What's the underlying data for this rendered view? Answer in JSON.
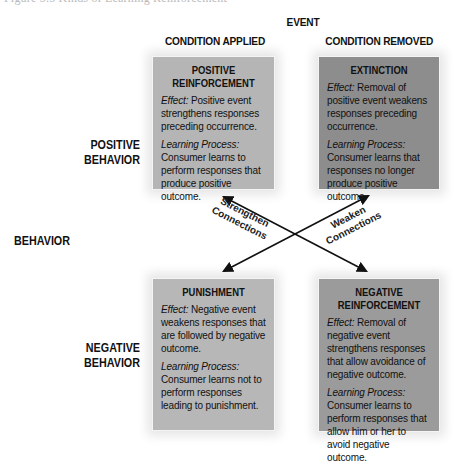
{
  "caption_fragment": "Figure 3.3 Kinds of Learning Reinforcement",
  "headers": {
    "event": "EVENT",
    "condition_applied": "CONDITION APPLIED",
    "condition_removed": "CONDITION REMOVED",
    "behavior": "BEHAVIOR",
    "positive_behavior_line1": "POSITIVE",
    "positive_behavior_line2": "BEHAVIOR",
    "negative_behavior_line1": "NEGATIVE",
    "negative_behavior_line2": "BEHAVIOR"
  },
  "boxes": {
    "positive_reinforcement": {
      "title_line1": "POSITIVE",
      "title_line2": "REINFORCEMENT",
      "effect_label": "Effect:",
      "effect_text": " Positive event strengthens responses preceding occurrence.",
      "process_label": "Learning Process:",
      "process_text": "Consumer learns to perform responses that produce positive outcome.",
      "color": "#b5b5b5"
    },
    "extinction": {
      "title_line1": "EXTINCTION",
      "effect_label": "Effect:",
      "effect_text": " Removal of positive event weakens responses preceding occurrence.",
      "process_label": "Learning Process:",
      "process_text": "Consumer learns that responses no longer produce positive outcome.",
      "color": "#8d8d8d"
    },
    "punishment": {
      "title_line1": "PUNISHMENT",
      "effect_label": "Effect:",
      "effect_text": " Negative event weakens responses that are followed by negative outcome.",
      "process_label": "Learning Process:",
      "process_text": "Consumer learns not to perform responses leading to punishment.",
      "color": "#b7b7b7"
    },
    "negative_reinforcement": {
      "title_line1": "NEGATIVE",
      "title_line2": "REINFORCEMENT",
      "effect_label": "Effect:",
      "effect_text": " Removal of negative event strengthens responses that allow avoidance of negative outcome.",
      "process_label": "Learning Process:",
      "process_text": "Consumer learns to perform responses that allow him or her to avoid negative outcome.",
      "color": "#9b9b9b"
    }
  },
  "arrows": {
    "strengthen_line1": "Strengthen",
    "strengthen_line2": "Connections",
    "weaken_line1": "Weaken",
    "weaken_line2": "Connections"
  }
}
